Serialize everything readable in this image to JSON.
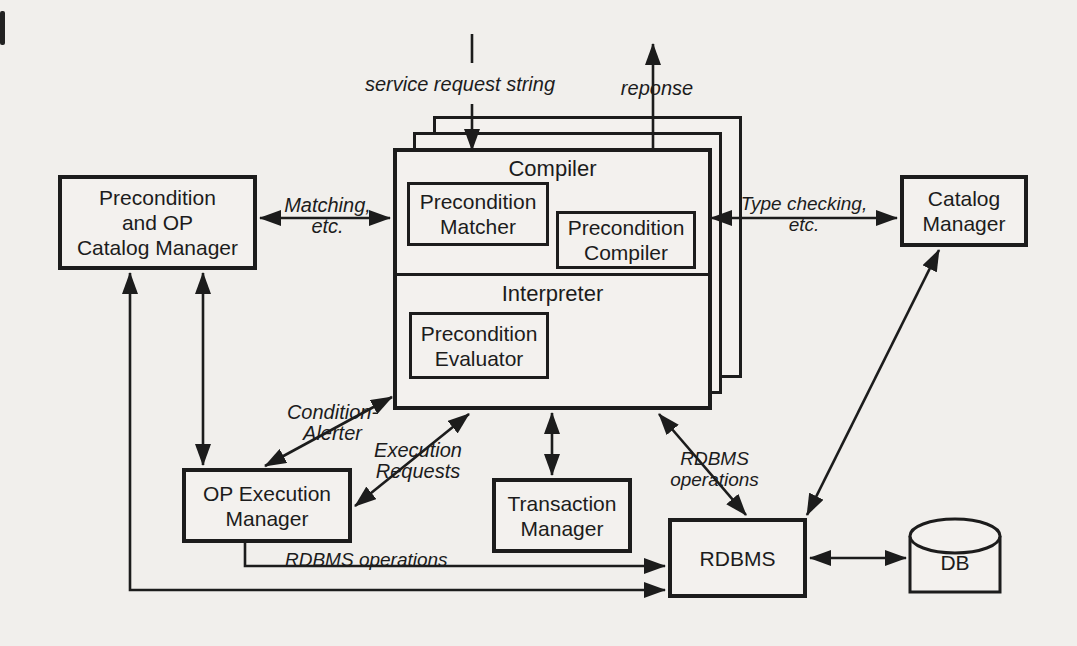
{
  "colors": {
    "ink": "#1c1c1c",
    "paper": "#f1efec"
  },
  "boxes": {
    "precondition_op_catalog_manager": "Precondition\nand OP\nCatalog Manager",
    "catalog_manager": "Catalog\nManager",
    "compiler_section": "Compiler",
    "interpreter_section": "Interpreter",
    "precondition_matcher": "Precondition\nMatcher",
    "precondition_compiler": "Precondition\nCompiler",
    "precondition_evaluator": "Precondition\nEvaluator",
    "op_execution_manager": "OP Execution\nManager",
    "transaction_manager": "Transaction\nManager",
    "rdbms": "RDBMS",
    "db": "DB"
  },
  "arrow_labels": {
    "service_request": "service request string",
    "response": "reponse",
    "matching": "Matching,\netc.",
    "type_checking": "Type checking,\netc.",
    "condition_alerter": "Condition-\nAlerter",
    "execution_requests": "Execution\nRequests",
    "rdbms_operations_bottom": "RDBMS operations",
    "rdbms_operations_right": "RDBMS\noperations"
  }
}
